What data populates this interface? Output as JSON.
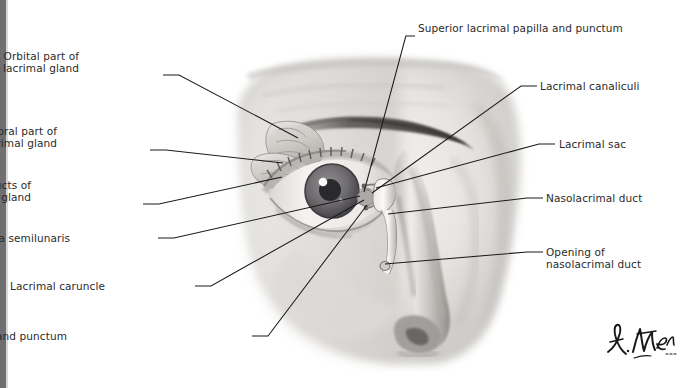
{
  "figure": {
    "artist_signature": "F. Netter M.D.",
    "style": "grayscale medical illustration, anterior view of right eye and nose"
  },
  "colors": {
    "background": "#ffffff",
    "text": "#2b2b2b",
    "leader_line": "#1b1b1b",
    "frame_band": "#6f6f6f",
    "skin_light": "#f1f0ee",
    "skin_mid": "#d2d0cd",
    "skin_dark": "#9a9794",
    "brow_dark": "#4c4a48",
    "iris": "#6e6b6e",
    "pupil": "#2a2a2c"
  },
  "labels": [
    {
      "id": "orbital-part-of-lacrimal-gland",
      "lines": [
        "Orbital part of",
        "lacrimal gland"
      ],
      "side": "left",
      "x": 79,
      "y": 50,
      "align": "right",
      "anchor_x": 163,
      "anchor_y": 75,
      "target_x": 298,
      "target_y": 138
    },
    {
      "id": "palpebral-part-of-lacrimal-gland",
      "lines": [
        "Palpebral part of",
        "lacrimal gland"
      ],
      "side": "left",
      "x": 57,
      "y": 125,
      "align": "right",
      "anchor_x": 150,
      "anchor_y": 150,
      "target_x": 283,
      "target_y": 163
    },
    {
      "id": "excretory-ducts-of-lacrimal-gland",
      "lines": [
        "Excretory ducts of",
        "lacrimal gland"
      ],
      "side": "left",
      "x": 31,
      "y": 179,
      "align": "right",
      "anchor_x": 143,
      "anchor_y": 204,
      "target_x": 282,
      "target_y": 177
    },
    {
      "id": "plica-semilunaris",
      "lines": [
        "Plica semilunaris"
      ],
      "side": "left",
      "x": 70,
      "y": 232,
      "align": "right",
      "anchor_x": 158,
      "anchor_y": 238,
      "target_x": 360,
      "target_y": 196
    },
    {
      "id": "lacrimal-caruncle",
      "lines": [
        "Lacrimal caruncle"
      ],
      "side": "left",
      "x": 105,
      "y": 280,
      "align": "right",
      "anchor_x": 195,
      "anchor_y": 286,
      "target_x": 364,
      "target_y": 200
    },
    {
      "id": "inferior-lacrimal-papilla-and-punctum",
      "lines": [
        "Inferior lacrimal papilla and punctum"
      ],
      "side": "left",
      "x": 67,
      "y": 330,
      "align": "right",
      "anchor_x": 252,
      "anchor_y": 336,
      "target_x": 367,
      "target_y": 205
    },
    {
      "id": "superior-lacrimal-papilla-and-punctum",
      "lines": [
        "Superior lacrimal papilla and punctum"
      ],
      "side": "top",
      "x": 418,
      "y": 22,
      "align": "left",
      "anchor_x": 415,
      "anchor_y": 36,
      "target_x": 364,
      "target_y": 192
    },
    {
      "id": "lacrimal-canaliculi",
      "lines": [
        "Lacrimal canaliculi"
      ],
      "side": "right",
      "x": 540,
      "y": 80,
      "align": "left",
      "anchor_x": 537,
      "anchor_y": 86,
      "target_x": 372,
      "target_y": 193
    },
    {
      "id": "lacrimal-sac",
      "lines": [
        "Lacrimal sac"
      ],
      "side": "right",
      "x": 559,
      "y": 138,
      "align": "left",
      "anchor_x": 555,
      "anchor_y": 144,
      "target_x": 376,
      "target_y": 188
    },
    {
      "id": "nasolacrimal-duct",
      "lines": [
        "Nasolacrimal duct"
      ],
      "side": "right",
      "x": 546,
      "y": 192,
      "align": "left",
      "anchor_x": 543,
      "anchor_y": 198,
      "target_x": 388,
      "target_y": 214
    },
    {
      "id": "opening-of-nasolacrimal-duct",
      "lines": [
        "Opening of",
        "nasolacrimal duct"
      ],
      "side": "right",
      "x": 546,
      "y": 246,
      "align": "left",
      "anchor_x": 543,
      "anchor_y": 252,
      "target_x": 385,
      "target_y": 264
    }
  ]
}
